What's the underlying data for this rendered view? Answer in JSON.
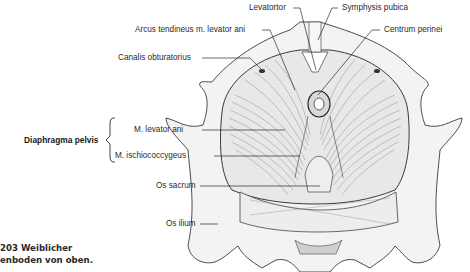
{
  "figure": {
    "caption_line1": "203    Weiblicher",
    "caption_line2": "enboden von oben."
  },
  "labels": {
    "levatortor": "Levatortor",
    "symphysis": "Symphysis pubica",
    "arcus": "Arcus tendineus m. levator ani",
    "centrum": "Centrum perinei",
    "canalis": "Canalis obturatorius",
    "diaphragma": "Diaphragma pelvis",
    "levator_ani": "M. levator ani",
    "ischio": "M. ischiococcygeus",
    "sacrum": "Os sacrum",
    "ilium": "Os ilium"
  },
  "colors": {
    "ink": "#2a2a2a",
    "bone": "#f2f2f0",
    "muscle": "#e6e6e6"
  }
}
